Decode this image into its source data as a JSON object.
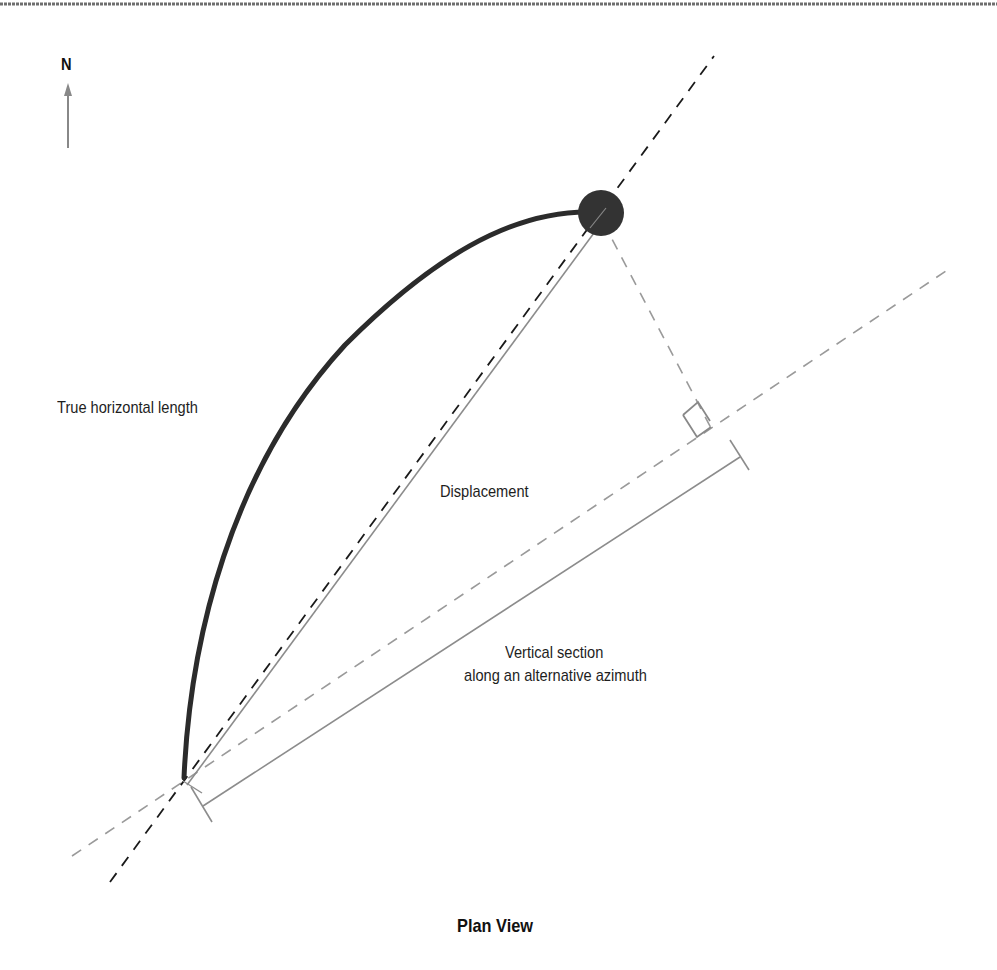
{
  "diagram": {
    "title": "Plan View",
    "north_label": "N",
    "labels": {
      "true_horizontal_length": "True horizontal length",
      "displacement": "Displacement",
      "vertical_section_line1": "Vertical section",
      "vertical_section_line2": "along an alternative azimuth"
    },
    "elements": {
      "north_arrow": "north-arrow-icon",
      "well_path": "curved well trajectory (thick dark line)",
      "target": "target circle (dark filled)",
      "displacement_line": "solid gray line from surface location to target",
      "displacement_azimuth_line": "black dashed line through surface location and target",
      "alternative_azimuth_line": "gray dashed line along alternative azimuth",
      "projection_line": "gray dashed perpendicular from target to alternative azimuth",
      "right_angle_marker": "right-angle square at projection foot",
      "vertical_section_dimension": "solid gray dimension line with end ticks"
    },
    "colors": {
      "well_path": "#2b2b2b",
      "target": "#333333",
      "black_dash": "#1a1a1a",
      "gray_line": "#8c8c8c",
      "gray_dash": "#9a9a9a",
      "top_rule": "#6e6e6e",
      "text": "#1e1e1e"
    }
  }
}
